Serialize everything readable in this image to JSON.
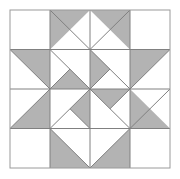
{
  "figure": {
    "type": "geometric-quilt-block",
    "canvas": {
      "width": 180,
      "height": 179
    },
    "background_color": "#ffffff"
  },
  "palette": {
    "background": "#ffffff",
    "patch_light": "#ffffff",
    "patch_shaded": "#b3b3b3",
    "stroke": "#808080",
    "outer_border_stroke": "#9a9a9a"
  },
  "grid": {
    "origin_x": 10,
    "origin_y": 10,
    "cell_size": 40,
    "columns": 4,
    "rows": 4,
    "block_width": 160,
    "block_height": 158,
    "show_grid_lines": true,
    "stroke_width": 1
  },
  "geometry": {
    "outer_border": {
      "x": 10,
      "y": 10,
      "width": 160,
      "height": 158
    },
    "grid_lines_vertical": [
      50,
      90,
      130
    ],
    "grid_lines_horizontal": [
      49.5,
      89,
      128.5
    ],
    "shaded_patches": [
      {
        "id": "r1c2-left-geese",
        "cell": "r1c2",
        "points": "50,10 90,10 50,49.5"
      },
      {
        "id": "r1c3-right-geese",
        "cell": "r1c3",
        "points": "90,10 130,10 130,49.5"
      },
      {
        "id": "r2c1-half-square",
        "cell": "r2c1",
        "points": "10,49.5 50,49.5 50,89"
      },
      {
        "id": "r2c2-star-point",
        "cell": "r2c2",
        "points": "50,89 90,89 70,69"
      },
      {
        "id": "r2c3-star-point",
        "cell": "r2c3",
        "points": "90,49.5 90,89 110,69"
      },
      {
        "id": "r2c4-half-square",
        "cell": "r2c4",
        "points": "130,49.5 170,49.5 130,89"
      },
      {
        "id": "r3c1-half-square",
        "cell": "r3c1",
        "points": "10,128.5 50,89 50,128.5"
      },
      {
        "id": "r3c2-star-point",
        "cell": "r3c2",
        "points": "90,89 90,128.5 70,108.75"
      },
      {
        "id": "r3c3-star-point",
        "cell": "r3c3",
        "points": "90,89 130,89 110,108.75"
      },
      {
        "id": "r3c4-half-square",
        "cell": "r3c4",
        "points": "130,89 130,128.5 170,128.5"
      },
      {
        "id": "r4c2-left-geese",
        "cell": "r4c2",
        "points": "50,128.5 90,168 50,168"
      },
      {
        "id": "r4c3-right-geese",
        "cell": "r4c3",
        "points": "130,128.5 130,168 90,168"
      }
    ],
    "detail_lines": [
      {
        "id": "r1c2-diag",
        "x1": 50,
        "y1": 10,
        "x2": 90,
        "y2": 49.5
      },
      {
        "id": "r1c3-diag",
        "x1": 130,
        "y1": 10,
        "x2": 90,
        "y2": 49.5
      },
      {
        "id": "r2c1-diag",
        "x1": 10,
        "y1": 49.5,
        "x2": 50,
        "y2": 89
      },
      {
        "id": "r2c2-diag-a",
        "x1": 50,
        "y1": 49.5,
        "x2": 90,
        "y2": 89
      },
      {
        "id": "r2c2-diag-b",
        "x1": 50,
        "y1": 89,
        "x2": 70,
        "y2": 69
      },
      {
        "id": "r2c3-diag-a",
        "x1": 90,
        "y1": 49.5,
        "x2": 130,
        "y2": 89
      },
      {
        "id": "r2c3-diag-b",
        "x1": 90,
        "y1": 89,
        "x2": 110,
        "y2": 69
      },
      {
        "id": "r2c4-diag",
        "x1": 130,
        "y1": 89,
        "x2": 170,
        "y2": 49.5
      },
      {
        "id": "r3c1-diag",
        "x1": 10,
        "y1": 128.5,
        "x2": 50,
        "y2": 89
      },
      {
        "id": "r3c2-diag-a",
        "x1": 50,
        "y1": 128.5,
        "x2": 90,
        "y2": 89
      },
      {
        "id": "r3c2-diag-b",
        "x1": 90,
        "y1": 128.5,
        "x2": 70,
        "y2": 108.75
      },
      {
        "id": "r3c3-diag-a",
        "x1": 90,
        "y1": 89,
        "x2": 130,
        "y2": 128.5
      },
      {
        "id": "r3c3-diag-b",
        "x1": 130,
        "y1": 89,
        "x2": 110,
        "y2": 108.75
      },
      {
        "id": "r3c4-diag",
        "x1": 130,
        "y1": 128.5,
        "x2": 170,
        "y2": 89
      },
      {
        "id": "r4c2-diag",
        "x1": 50,
        "y1": 128.5,
        "x2": 90,
        "y2": 168
      },
      {
        "id": "r4c3-diag",
        "x1": 130,
        "y1": 128.5,
        "x2": 90,
        "y2": 168
      }
    ]
  },
  "patch_counts": {
    "shaded": 12,
    "light": 20,
    "total_cells": 16
  }
}
